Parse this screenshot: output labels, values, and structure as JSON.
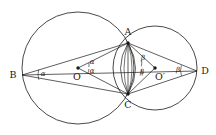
{
  "figure": {
    "type": "geometry-diagram",
    "background_color": "#ffffff",
    "stroke_color": "#1a1a1a"
  },
  "points": [
    {
      "id": "A",
      "label": "A",
      "x": 128,
      "y": 43,
      "label_x": 128,
      "label_y": 32,
      "marked": true
    },
    {
      "id": "B",
      "label": "B",
      "x": 22,
      "y": 75,
      "label_x": 13,
      "label_y": 75,
      "marked": false
    },
    {
      "id": "C",
      "label": "C",
      "x": 128,
      "y": 94,
      "label_x": 128,
      "label_y": 105,
      "marked": true
    },
    {
      "id": "D",
      "label": "D",
      "x": 197,
      "y": 71,
      "label_x": 205,
      "label_y": 71,
      "marked": false
    },
    {
      "id": "O",
      "label": "O",
      "x": 78,
      "y": 68,
      "label_x": 77,
      "label_y": 77,
      "marked": true
    },
    {
      "id": "Oprime",
      "label": "O′",
      "x": 155,
      "y": 68,
      "label_x": 160,
      "label_y": 77,
      "marked": true
    }
  ],
  "circles": [
    {
      "id": "circle-O",
      "center_x": 78,
      "center_y": 68,
      "radius": 56
    },
    {
      "id": "circle-Oprime",
      "center_x": 155,
      "center_y": 68,
      "radius": 42
    }
  ],
  "segments": [
    {
      "id": "B-A",
      "from": "B",
      "to": "A"
    },
    {
      "id": "B-C",
      "from": "B",
      "to": "C"
    },
    {
      "id": "A-D",
      "from": "A",
      "to": "D"
    },
    {
      "id": "C-D",
      "from": "C",
      "to": "D"
    },
    {
      "id": "O-A",
      "from": "O",
      "to": "A"
    },
    {
      "id": "O-C",
      "from": "O",
      "to": "C"
    },
    {
      "id": "Op-A",
      "from": "Oprime",
      "to": "A"
    },
    {
      "id": "Op-C",
      "from": "Oprime",
      "to": "C"
    },
    {
      "id": "A-C",
      "from": "A",
      "to": "C"
    },
    {
      "id": "B-D-axis",
      "from": "B",
      "to": "D"
    }
  ],
  "angle_labels": [
    {
      "id": "alpha-at-B",
      "text": "α",
      "x": 43,
      "y": 74
    },
    {
      "id": "alpha-at-O-upper",
      "text": "α",
      "x": 92,
      "y": 62
    },
    {
      "id": "alpha-at-O-lower",
      "text": "α",
      "x": 92,
      "y": 71
    },
    {
      "id": "beta-at-Op-upper",
      "text": "β",
      "x": 143,
      "y": 58
    },
    {
      "id": "beta-at-Op-lower",
      "text": "β",
      "x": 142,
      "y": 72
    },
    {
      "id": "beta-at-D",
      "text": "β",
      "x": 178,
      "y": 70
    }
  ],
  "angle_arcs": [
    {
      "id": "arc-B",
      "cx": 22,
      "cy": 75,
      "r": 17
    },
    {
      "id": "arc-O-upper",
      "cx": 78,
      "cy": 68,
      "r": 11
    },
    {
      "id": "arc-O-lower",
      "cx": 78,
      "cy": 68,
      "r": 11
    },
    {
      "id": "arc-Op-upper",
      "cx": 155,
      "cy": 68,
      "r": 14
    },
    {
      "id": "arc-Op-lower",
      "cx": 155,
      "cy": 68,
      "r": 14
    },
    {
      "id": "arc-D",
      "cx": 197,
      "cy": 71,
      "r": 16
    }
  ]
}
